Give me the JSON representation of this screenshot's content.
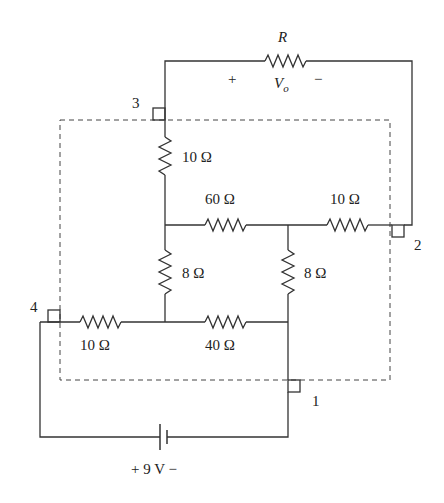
{
  "diagram": {
    "type": "circuit",
    "resistors": {
      "load": {
        "label": "R",
        "voltage_label": "V",
        "voltage_sub": "o",
        "plus": "+",
        "minus": "−"
      },
      "r_top_vertical": {
        "label": "10 Ω"
      },
      "r_mid_horizontal": {
        "label": "60 Ω"
      },
      "r_right_horizontal": {
        "label": "10 Ω"
      },
      "r_left_vertical": {
        "label": "8 Ω"
      },
      "r_right_vertical": {
        "label": "8 Ω"
      },
      "r_bottom_left": {
        "label": "10 Ω"
      },
      "r_bottom_right": {
        "label": "40 Ω"
      }
    },
    "source": {
      "label": "+ 9 V −",
      "value": "9 V"
    },
    "terminals": [
      {
        "id": "1",
        "label": "1"
      },
      {
        "id": "2",
        "label": "2"
      },
      {
        "id": "3",
        "label": "3"
      },
      {
        "id": "4",
        "label": "4"
      }
    ],
    "colors": {
      "wire": "#333333",
      "dashed_box": "#444444",
      "background": "#ffffff"
    }
  }
}
